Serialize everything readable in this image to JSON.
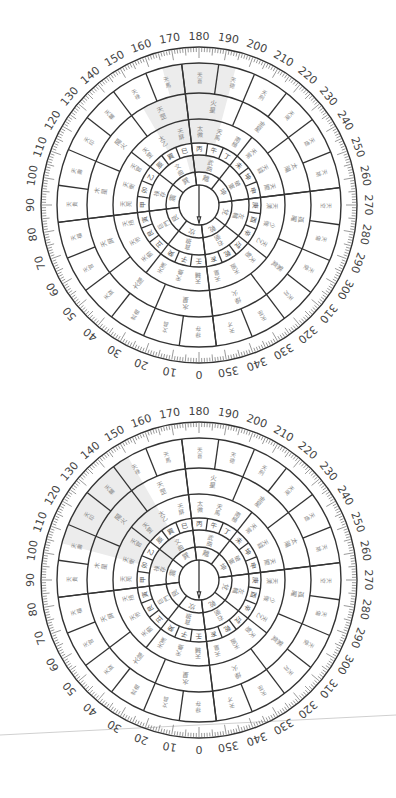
{
  "page": {
    "background": "#ffffff"
  },
  "compasses": [
    {
      "id": "compass-top",
      "center": [
        199,
        205
      ],
      "radius": 158,
      "rotation_deg": 180,
      "shaded_sectors": [
        {
          "ring": 6,
          "from_deg": 345,
          "to_deg": 15
        },
        {
          "ring": 5,
          "from_deg": 330,
          "to_deg": 15
        },
        {
          "ring": 4,
          "from_deg": 330,
          "to_deg": 15
        },
        {
          "ring": 2,
          "from_deg": 345,
          "to_deg": 15
        }
      ]
    },
    {
      "id": "compass-bottom",
      "center": [
        199,
        580
      ],
      "radius": 158,
      "rotation_deg": 180,
      "shaded_sectors": [
        {
          "ring": 6,
          "from_deg": 285,
          "to_deg": 330
        },
        {
          "ring": 5,
          "from_deg": 285,
          "to_deg": 330
        },
        {
          "ring": 4,
          "from_deg": 285,
          "to_deg": 330
        },
        {
          "ring": 2,
          "from_deg": 285,
          "to_deg": 330
        }
      ]
    }
  ],
  "degree_labels": [
    "0",
    "10",
    "20",
    "30",
    "40",
    "50",
    "60",
    "70",
    "80",
    "90",
    "100",
    "110",
    "120",
    "130",
    "140",
    "150",
    "160",
    "170",
    "180",
    "190",
    "200",
    "210",
    "220",
    "230",
    "240",
    "250",
    "260",
    "270",
    "280",
    "290",
    "300",
    "310",
    "320",
    "330",
    "340",
    "350"
  ],
  "rings": {
    "center_radius": 20,
    "boundaries": [
      20,
      33,
      50,
      62,
      86,
      112,
      142,
      158
    ],
    "ring1_chars": [
      "坎",
      "艮",
      "震",
      "巽",
      "離",
      "坤",
      "兌",
      "乾"
    ],
    "ring2_chars": [
      "貪狼",
      "巨門",
      "祿存",
      "文曲",
      "武曲",
      "破軍",
      "左輔",
      "右弼"
    ],
    "ring3_chars": [
      "壬",
      "子",
      "癸",
      "丑",
      "艮",
      "寅",
      "甲",
      "卯",
      "乙",
      "辰",
      "巽",
      "巳",
      "丙",
      "午",
      "丁",
      "未",
      "坤",
      "申",
      "庚",
      "酉",
      "辛",
      "戌",
      "乾",
      "亥"
    ],
    "ring4_chars": [
      "天輔",
      "天壘",
      "天漢",
      "天廚",
      "天市",
      "天掊",
      "天苑",
      "天衡",
      "天官",
      "天罡",
      "太乙",
      "天屏",
      "太微",
      "天馬",
      "南極",
      "天常",
      "天錢",
      "天關",
      "天潢",
      "少微",
      "天乙",
      "天魁",
      "天廄",
      "天皇"
    ],
    "ring5_chars": [
      "水星",
      "太陰",
      "天屏",
      "木星",
      "陽火",
      "天罡",
      "火星",
      "金星",
      "太陽",
      "孤曜",
      "紫氣",
      "燥火"
    ],
    "ring6_chars": [
      "禄存",
      "文昌",
      "武曲",
      "天財",
      "天官",
      "天福",
      "天貴",
      "天壽",
      "天印",
      "天輔",
      "天祿",
      "天馬",
      "天喜",
      "天德",
      "天刑",
      "天哭",
      "天虛",
      "天姚",
      "天空",
      "天傷",
      "天使",
      "天月",
      "天巫",
      "天才"
    ]
  },
  "needle": {
    "icon": "arrow-up-icon",
    "color": "#333333"
  },
  "colors": {
    "stroke": "#333333",
    "text_light": "#888888",
    "shade": "#ececec"
  },
  "stray_line": {
    "from": [
      0,
      735
    ],
    "to": [
      396,
      715
    ],
    "color": "#d0d0d0"
  }
}
